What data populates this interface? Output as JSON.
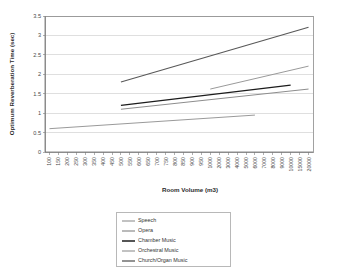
{
  "chart_data": {
    "type": "line",
    "title": "",
    "xlabel": "Room Volume (m3)",
    "ylabel": "Optimum Reverberation Time (sec)",
    "ylim": [
      0,
      3.5
    ],
    "ytick_values": [
      0,
      0.5,
      1,
      1.5,
      2,
      2.5,
      3,
      3.5
    ],
    "ytick_labels": [
      "0",
      "0.5",
      "1",
      "1.5",
      "2",
      "2.5",
      "3",
      "3.5"
    ],
    "grid": true,
    "legend_position": "bottom-center",
    "categories": [
      "100",
      "150",
      "200",
      "250",
      "300",
      "350",
      "400",
      "450",
      "500",
      "550",
      "600",
      "650",
      "700",
      "750",
      "800",
      "850",
      "900",
      "950",
      "1000",
      "2000",
      "3000",
      "4000",
      "5000",
      "6000",
      "7000",
      "8000",
      "9000",
      "10000",
      "15000",
      "20000"
    ],
    "series": [
      {
        "name": "Speech",
        "color": "#9a9a9a",
        "width": 1.0,
        "x_start": "100",
        "x_end": "6000",
        "y_start": 0.6,
        "y_end": 0.95,
        "points": [
          {
            "x": "100",
            "y": 0.6
          },
          {
            "x": "6000",
            "y": 0.95
          }
        ]
      },
      {
        "name": "Opera",
        "color": "#8d8d8d",
        "width": 1.0,
        "x_start": "500",
        "x_end": "20000",
        "y_start": 1.1,
        "y_end": 1.62,
        "points": [
          {
            "x": "500",
            "y": 1.1
          },
          {
            "x": "20000",
            "y": 1.62
          }
        ]
      },
      {
        "name": "Chamber Music",
        "color": "#1c1c1c",
        "width": 1.3,
        "x_start": "500",
        "x_end": "10000",
        "y_start": 1.2,
        "y_end": 1.72,
        "points": [
          {
            "x": "500",
            "y": 1.2
          },
          {
            "x": "10000",
            "y": 1.72
          }
        ]
      },
      {
        "name": "Orchestral Music",
        "color": "#9a9a9a",
        "width": 1.0,
        "x_start": "1000",
        "x_end": "20000",
        "y_start": 1.62,
        "y_end": 2.21,
        "points": [
          {
            "x": "1000",
            "y": 1.62
          },
          {
            "x": "20000",
            "y": 2.21
          }
        ]
      },
      {
        "name": "Church/Organ Music",
        "color": "#585858",
        "width": 1.1,
        "x_start": "500",
        "x_end": "20000",
        "y_start": 1.8,
        "y_end": 3.21,
        "points": [
          {
            "x": "500",
            "y": 1.8
          },
          {
            "x": "20000",
            "y": 3.21
          }
        ]
      }
    ]
  },
  "legend": {
    "items": [
      {
        "label": "Speech"
      },
      {
        "label": "Opera"
      },
      {
        "label": "Chamber Music"
      },
      {
        "label": "Orchestral Music"
      },
      {
        "label": "Church/Organ Music"
      }
    ]
  }
}
